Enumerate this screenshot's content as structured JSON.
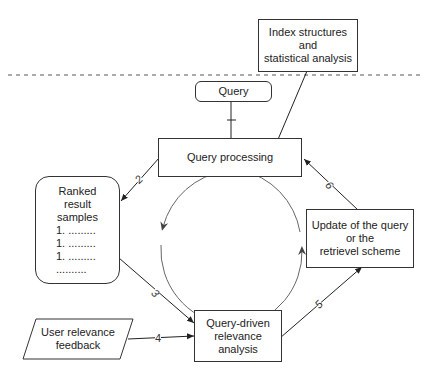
{
  "diagram": {
    "nodes": {
      "index": {
        "lines": [
          "Index structures",
          "and",
          "statistical analysis"
        ]
      },
      "query": {
        "label": "Query"
      },
      "processing": {
        "label": "Query processing"
      },
      "ranked": {
        "lines": [
          "Ranked",
          "result",
          "samples"
        ],
        "items": [
          "1. .........",
          "1. .........",
          "1. .........",
          ".........."
        ]
      },
      "update": {
        "lines": [
          "Update of the query",
          "or the",
          "retrievel scheme"
        ]
      },
      "relevance": {
        "lines": [
          "Query-driven",
          "relevance",
          "analysis"
        ]
      },
      "feedback": {
        "lines": [
          "User relevance",
          "feedback"
        ]
      }
    },
    "edges": [
      {
        "from": "query",
        "to": "processing",
        "label": "1"
      },
      {
        "from": "processing",
        "to": "ranked",
        "label": "2"
      },
      {
        "from": "ranked",
        "to": "relevance",
        "label": "3"
      },
      {
        "from": "feedback",
        "to": "relevance",
        "label": "4"
      },
      {
        "from": "relevance",
        "to": "update",
        "label": "5"
      },
      {
        "from": "update",
        "to": "processing",
        "label": "6"
      },
      {
        "from": "index",
        "to": "processing",
        "label": ""
      }
    ],
    "cycle": {
      "direction": "counter-clockwise"
    }
  }
}
